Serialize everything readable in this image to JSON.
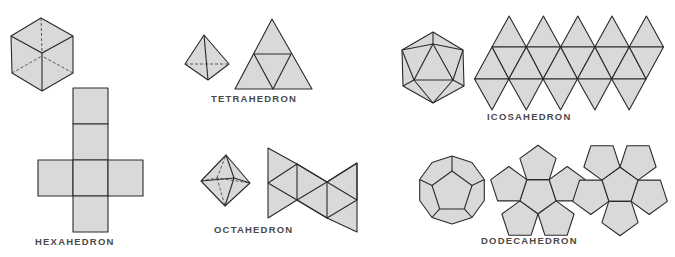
{
  "figure": {
    "colors": {
      "face": "#d9d9d9",
      "edge": "#2a2a2a",
      "label": "#4a4a4a",
      "background": "#ffffff"
    },
    "solids": [
      {
        "id": "hexahedron",
        "label": "HEXAHEDRON",
        "faces": 6,
        "face_shape": "square",
        "net": "cross"
      },
      {
        "id": "tetrahedron",
        "label": "TETRAHEDRON",
        "faces": 4,
        "face_shape": "triangle",
        "net": "triangle"
      },
      {
        "id": "octahedron",
        "label": "OCTAHEDRON",
        "faces": 8,
        "face_shape": "triangle",
        "net": "bowtie"
      },
      {
        "id": "icosahedron",
        "label": "ICOSAHEDRON",
        "faces": 20,
        "face_shape": "triangle",
        "net": "strip"
      },
      {
        "id": "dodecahedron",
        "label": "DODECAHEDRON",
        "faces": 12,
        "face_shape": "pentagon",
        "net": "two-flowers"
      }
    ]
  }
}
